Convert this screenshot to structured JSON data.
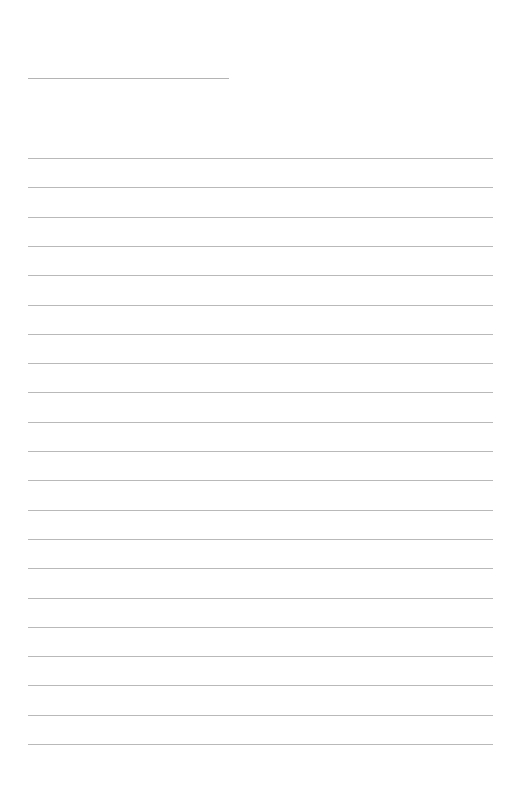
{
  "page": {
    "type": "lined-paper",
    "title_line": {
      "x": 28,
      "y": 78,
      "width": 201
    },
    "rules": {
      "count": 21,
      "first_y": 158,
      "spacing": 29.3,
      "x": 28,
      "width": 465
    },
    "colors": {
      "background": "#ffffff",
      "rule": "#b9b9b9"
    }
  }
}
